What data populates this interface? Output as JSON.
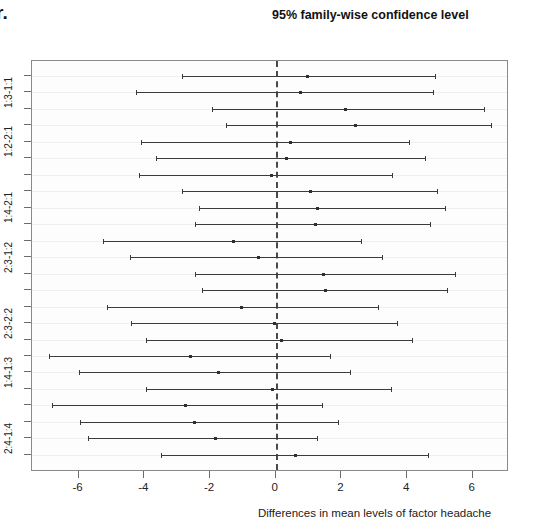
{
  "corner_text": "r.",
  "chart_title": "95% family-wise confidence level",
  "axis": {
    "xlabel": "Differences in mean levels of factor  headache",
    "x_ticks": [
      "-6",
      "-4",
      "-2",
      "0",
      "2",
      "4",
      "6"
    ],
    "y_tick_labels": [
      "1:3-1:1",
      "1:2-2:1",
      "1:4-2:1",
      "2:3-1:2",
      "2:3-2:2",
      "1:4-1:3",
      "2:4-1:4"
    ]
  },
  "colors": {
    "line": "#3b3b3b",
    "zero_line": "#4a4a4a",
    "frame": "#8a8a8a",
    "grid": "#f0f0f0",
    "text": "#1a1a1a"
  },
  "chart_data": {
    "type": "line",
    "subtype": "confidence-interval-dotplot",
    "title": "95% family-wise confidence level",
    "xlabel": "Differences in mean levels of factor  headache",
    "ylabel": "",
    "xlim": [
      -7.4,
      7.1
    ],
    "ylim": [
      0,
      24
    ],
    "grid": true,
    "legend": null,
    "x_ticks": [
      -6,
      -4,
      -2,
      0,
      2,
      4,
      6
    ],
    "zero_reference": 0,
    "y_labeled_ticks": [
      {
        "index": 1,
        "label": "1:3-1:1"
      },
      {
        "index": 4,
        "label": "1:2-2:1"
      },
      {
        "index": 8,
        "label": "1:4-2:1"
      },
      {
        "index": 11,
        "label": "2:3-1:2"
      },
      {
        "index": 15,
        "label": "2:3-2:2"
      },
      {
        "index": 18,
        "label": "1:4-1:3"
      },
      {
        "index": 22,
        "label": "2:4-1:4"
      }
    ],
    "intervals": [
      {
        "row": 1,
        "label": "1:3-1:1",
        "lower": -2.85,
        "estimate": 0.95,
        "upper": 4.85
      },
      {
        "row": 2,
        "label": "",
        "lower": -4.25,
        "estimate": 0.75,
        "upper": 4.8
      },
      {
        "row": 3,
        "label": "",
        "lower": -1.95,
        "estimate": 2.1,
        "upper": 6.35
      },
      {
        "row": 4,
        "label": "1:2-2:1",
        "lower": -1.5,
        "estimate": 2.4,
        "upper": 6.55
      },
      {
        "row": 5,
        "label": "",
        "lower": -4.1,
        "estimate": 0.45,
        "upper": 4.05
      },
      {
        "row": 6,
        "label": "",
        "lower": -3.65,
        "estimate": 0.3,
        "upper": 4.55
      },
      {
        "row": 7,
        "label": "",
        "lower": -4.15,
        "estimate": -0.15,
        "upper": 3.55
      },
      {
        "row": 8,
        "label": "1:4-2:1",
        "lower": -2.85,
        "estimate": 1.05,
        "upper": 4.9
      },
      {
        "row": 9,
        "label": "",
        "lower": -2.35,
        "estimate": 1.25,
        "upper": 5.15
      },
      {
        "row": 10,
        "label": "",
        "lower": -2.45,
        "estimate": 1.2,
        "upper": 4.7
      },
      {
        "row": 11,
        "label": "2:3-1:2",
        "lower": -5.25,
        "estimate": -1.3,
        "upper": 2.6
      },
      {
        "row": 12,
        "label": "",
        "lower": -4.45,
        "estimate": -0.55,
        "upper": 3.25
      },
      {
        "row": 13,
        "label": "",
        "lower": -2.45,
        "estimate": 1.45,
        "upper": 5.45
      },
      {
        "row": 14,
        "label": "",
        "lower": -2.25,
        "estimate": 1.5,
        "upper": 5.2
      },
      {
        "row": 15,
        "label": "2:3-2:2",
        "lower": -5.15,
        "estimate": -1.05,
        "upper": 3.1
      },
      {
        "row": 16,
        "label": "",
        "lower": -4.4,
        "estimate": -0.05,
        "upper": 3.7
      },
      {
        "row": 17,
        "label": "",
        "lower": -3.95,
        "estimate": 0.15,
        "upper": 4.15
      },
      {
        "row": 18,
        "label": "1:4-1:3",
        "lower": -6.9,
        "estimate": -2.6,
        "upper": 1.65
      },
      {
        "row": 19,
        "label": "",
        "lower": -6.0,
        "estimate": -1.75,
        "upper": 2.25
      },
      {
        "row": 20,
        "label": "",
        "lower": -3.95,
        "estimate": -0.1,
        "upper": 3.5
      },
      {
        "row": 21,
        "label": "",
        "lower": -6.8,
        "estimate": -2.75,
        "upper": 1.4
      },
      {
        "row": 22,
        "label": "2:4-1:4",
        "lower": -5.95,
        "estimate": -2.5,
        "upper": 1.9
      },
      {
        "row": 23,
        "label": "",
        "lower": -5.7,
        "estimate": -1.85,
        "upper": 1.25
      },
      {
        "row": 24,
        "label": "",
        "lower": -3.5,
        "estimate": 0.6,
        "upper": 4.65
      }
    ]
  }
}
